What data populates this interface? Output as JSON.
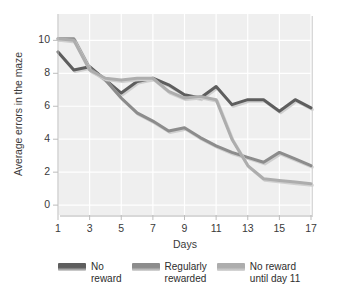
{
  "chart_data": {
    "type": "line",
    "title": "",
    "xlabel": "Days",
    "ylabel": "Average errors in the maze",
    "xlim": [
      1,
      17
    ],
    "ylim": [
      -0.6,
      11.6
    ],
    "xticks": [
      1,
      3,
      5,
      7,
      9,
      11,
      13,
      15,
      17
    ],
    "yticks": [
      0,
      2,
      4,
      6,
      8,
      10
    ],
    "grid": true,
    "legend_position": "below",
    "x": [
      1,
      2,
      3,
      4,
      5,
      6,
      7,
      8,
      9,
      10,
      11,
      12,
      13,
      14,
      15,
      16,
      17
    ],
    "series": [
      {
        "name": "No reward",
        "color": "#5e5e5e",
        "values": [
          9.3,
          8.2,
          8.4,
          7.6,
          6.8,
          7.5,
          7.7,
          7.3,
          6.7,
          6.5,
          7.2,
          6.1,
          6.4,
          6.4,
          5.7,
          6.4,
          5.9
        ]
      },
      {
        "name": "Regularly rewarded",
        "color": "#8c8c8c",
        "values": [
          10.1,
          10.1,
          8.3,
          7.6,
          6.5,
          5.6,
          5.1,
          4.5,
          4.7,
          4.1,
          3.6,
          3.2,
          2.9,
          2.6,
          3.2,
          2.8,
          2.4
        ]
      },
      {
        "name": "No reward until day 11",
        "color": "#adadad",
        "values": [
          10.1,
          10.0,
          8.2,
          7.7,
          7.6,
          7.7,
          7.7,
          6.9,
          6.5,
          6.6,
          6.4,
          4.0,
          2.4,
          1.6,
          1.5,
          1.4,
          1.3
        ]
      }
    ]
  },
  "legend": {
    "items": [
      {
        "label": "No\nreward",
        "color": "#5e5e5e"
      },
      {
        "label": "Regularly\nrewarded",
        "color": "#8c8c8c"
      },
      {
        "label": "No reward\nuntil day 11",
        "color": "#adadad"
      }
    ]
  },
  "axes": {
    "y_title": "Average errors in the maze",
    "x_title": "Days",
    "y_tick_labels": [
      "10",
      "8",
      "6",
      "4",
      "2",
      "0"
    ],
    "x_tick_labels": [
      "1",
      "3",
      "5",
      "7",
      "9",
      "11",
      "13",
      "15",
      "17"
    ]
  },
  "style": {
    "plot_background": "#efefef",
    "grid_color": "#ffffff",
    "text_color": "#3a3a3a"
  }
}
